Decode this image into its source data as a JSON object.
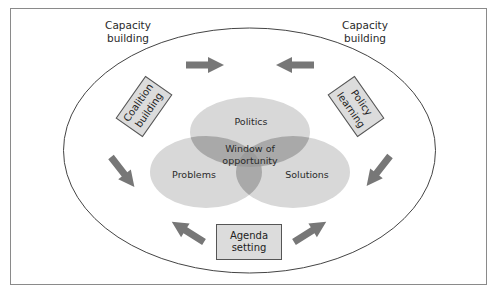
{
  "diagram": {
    "outer_labels": {
      "capacity_left": {
        "line1": "Capacity",
        "line2": "building"
      },
      "capacity_right": {
        "line1": "Capacity",
        "line2": "building"
      }
    },
    "boxes": {
      "coalition": {
        "line1": "Coalition",
        "line2": "building"
      },
      "policy": {
        "line1": "Policy",
        "line2": "learning"
      },
      "agenda": {
        "line1": "Agenda",
        "line2": "setting"
      }
    },
    "venn": {
      "politics": "Politics",
      "problems": "Problems",
      "solutions": "Solutions",
      "center": {
        "line1": "Window of",
        "line2": "opportunity"
      }
    },
    "arrows": [
      {
        "id": "top-right",
        "direction": "right"
      },
      {
        "id": "top-left",
        "direction": "left"
      },
      {
        "id": "left-down",
        "direction": "down-right"
      },
      {
        "id": "right-down",
        "direction": "down-left"
      },
      {
        "id": "bottom-left",
        "direction": "up-left"
      },
      {
        "id": "bottom-right",
        "direction": "up-right"
      }
    ],
    "colors": {
      "ellipse_fill": "#d8d8d8",
      "overlap_fill": "#a9a9a9",
      "center_fill": "#9a9a9a",
      "arrow": "#777777",
      "box_fill": "#dcdcdc",
      "outline": "#555555"
    }
  }
}
